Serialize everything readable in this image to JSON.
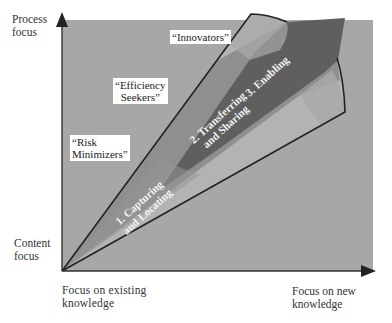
{
  "diagram": {
    "axes": {
      "y_top_label": "Process focus",
      "y_top_line1": "Process",
      "y_top_line2": "focus",
      "y_bottom_line1": "Content",
      "y_bottom_line2": "focus",
      "x_left_line1": "Focus on existing",
      "x_left_line2": "knowledge",
      "x_right_line1": "Focus on new",
      "x_right_line2": "knowledge"
    },
    "regions": {
      "innovators": "“Innovators”",
      "efficiency_line1": "“Efficiency",
      "efficiency_line2": "Seekers”",
      "risk_line1": "“Risk",
      "risk_line2": "Minimizers”"
    },
    "phases": {
      "p1_line1": "1. Capturing",
      "p1_line2": "and Locating",
      "p2_line1": "2. Transferring",
      "p2_line2": "and Sharing",
      "p3_line1": "3. Enabling"
    },
    "colors": {
      "background": "#a9a9a9",
      "wedge_light": "#b4b4b4",
      "wedge_mid": "#8c8c8c",
      "arrow_dark": "#5e5e5e",
      "outline": "#222222"
    }
  }
}
